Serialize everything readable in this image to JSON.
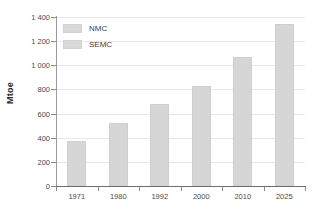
{
  "chart_data": {
    "type": "bar",
    "title": "",
    "subtitle": "",
    "xlabel": "",
    "ylabel": "Mtoe",
    "categories": [
      "1971",
      "1980",
      "1992",
      "2000",
      "2010",
      "2025"
    ],
    "values": [
      375,
      520,
      680,
      830,
      1070,
      1340
    ],
    "series": [
      {
        "name": "NMC",
        "values": [
          375,
          520,
          680,
          830,
          1070,
          1340
        ]
      }
    ],
    "legend": [
      "NMC",
      "SEMC"
    ],
    "legend_position": "top-left-inside",
    "ylim": [
      0,
      1400
    ],
    "yticks": [
      0,
      200,
      400,
      600,
      800,
      1000,
      1200,
      1400
    ],
    "ytick_labels": [
      "0",
      "200",
      "400",
      "600",
      "800",
      "1 000",
      "1 200",
      "1 400"
    ],
    "grid": true,
    "grid_axis": "y",
    "bar_color": "#d6d6d6",
    "grid_color": "#e8e8e8",
    "axis_color": "#6e6e6e",
    "background": "#ffffff"
  }
}
